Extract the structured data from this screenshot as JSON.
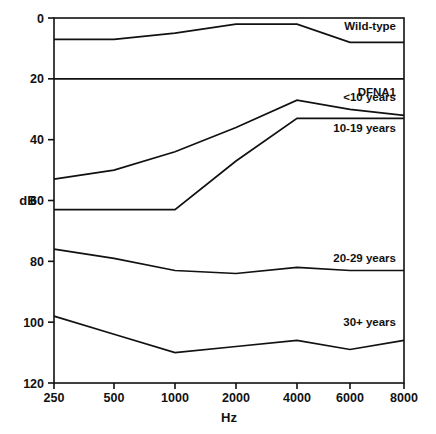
{
  "chart_data": {
    "type": "line",
    "title": "",
    "xlabel": "Hz",
    "ylabel": "dB",
    "x": [
      250,
      500,
      1000,
      2000,
      4000,
      6000,
      8000
    ],
    "xtick_labels": [
      "250",
      "500",
      "1000",
      "2000",
      "4000",
      "6000",
      "8000"
    ],
    "ytick_labels": [
      "0",
      "20",
      "40",
      "60",
      "80",
      "100",
      "120"
    ],
    "ytick_values": [
      0,
      20,
      40,
      60,
      80,
      100,
      120
    ],
    "ylim": [
      0,
      120
    ],
    "y_inverted": true,
    "x_scale": "log",
    "grid": false,
    "legend_position": "right-inline",
    "group_label": "DFNA1",
    "separator_db": 20,
    "series": [
      {
        "name": "Wild-type",
        "label": "Wild-type",
        "values": [
          7,
          7,
          5,
          2,
          2,
          8,
          8
        ]
      },
      {
        "name": "<10 years",
        "label": "<10 years",
        "values": [
          53,
          50,
          44,
          36,
          27,
          30,
          32
        ]
      },
      {
        "name": "10-19 years",
        "label": "10-19 years",
        "values": [
          63,
          63,
          63,
          47,
          33,
          33,
          33
        ]
      },
      {
        "name": "20-29 years",
        "label": "20-29 years",
        "values": [
          76,
          79,
          83,
          84,
          82,
          83,
          83
        ]
      },
      {
        "name": "30+ years",
        "label": "30+ years",
        "values": [
          98,
          104,
          110,
          108,
          106,
          109,
          106
        ]
      }
    ]
  },
  "style": {
    "line_color": "#111111",
    "axis_color": "#111111",
    "background": "#ffffff"
  }
}
